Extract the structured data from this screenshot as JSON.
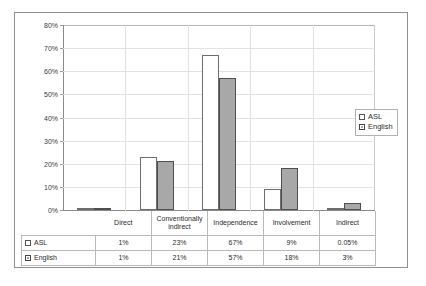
{
  "chart_data": {
    "type": "bar",
    "title": "",
    "xlabel": "",
    "ylabel": "",
    "ylim": [
      0,
      80
    ],
    "ytick_labels": [
      "0%",
      "10%",
      "20%",
      "30%",
      "40%",
      "50%",
      "60%",
      "70%",
      "80%"
    ],
    "ytick_values": [
      0,
      10,
      20,
      30,
      40,
      50,
      60,
      70,
      80
    ],
    "grid": true,
    "legend_position": "right",
    "categories": [
      "Direct",
      "Conventionally indirect",
      "Independence",
      "Involvement",
      "Indirect"
    ],
    "series": [
      {
        "name": "ASL",
        "values": [
          1,
          23,
          67,
          9,
          0.05
        ],
        "labels": [
          "1%",
          "23%",
          "67%",
          "9%",
          "0.05%"
        ],
        "color": "#ffffff",
        "border": "#6d6d6d"
      },
      {
        "name": "English",
        "values": [
          1,
          21,
          57,
          18,
          3
        ],
        "labels": [
          "1%",
          "21%",
          "57%",
          "18%",
          "3%"
        ],
        "color": "#a8a8a8",
        "border": "#4f4f4f"
      }
    ]
  },
  "legend": {
    "items": [
      {
        "label": "ASL",
        "swatch": "white-square-icon"
      },
      {
        "label": "English",
        "swatch": "gray-square-icon"
      }
    ]
  },
  "data_table": {
    "column_headers": [
      "Direct",
      "Conventionally indirect",
      "Independence",
      "Involvement",
      "Indirect"
    ],
    "rows": [
      {
        "name": "ASL",
        "cells": [
          "1%",
          "23%",
          "67%",
          "9%",
          "0.05%"
        ]
      },
      {
        "name": "English",
        "cells": [
          "1%",
          "21%",
          "57%",
          "18%",
          "3%"
        ]
      }
    ]
  }
}
